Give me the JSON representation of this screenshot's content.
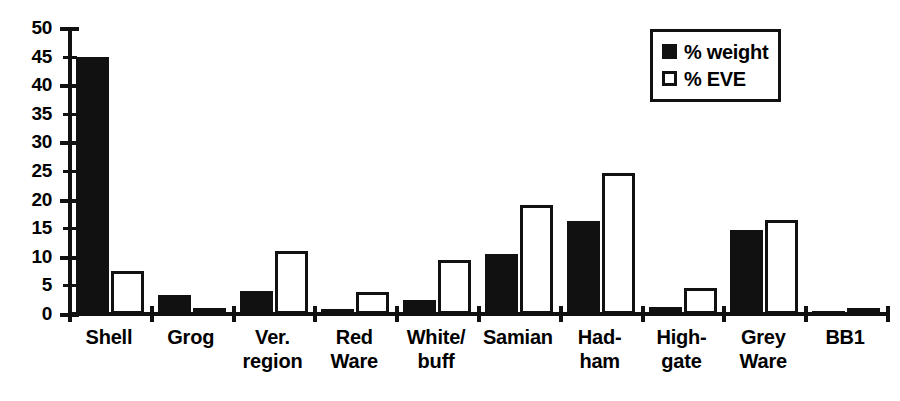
{
  "chart_data": {
    "type": "bar",
    "title": "",
    "xlabel": "",
    "ylabel": "",
    "ylim": [
      0,
      50
    ],
    "yticks": [
      0,
      5,
      10,
      15,
      20,
      25,
      30,
      35,
      40,
      45,
      50
    ],
    "grid": false,
    "legend_position": "top-right",
    "categories": [
      "Shell",
      "Grog",
      "Ver. region",
      "Red Ware",
      "White/ buff",
      "Samian",
      "Had- ham",
      "High- gate",
      "Grey Ware",
      "BB1"
    ],
    "category_lines": [
      [
        "Shell"
      ],
      [
        "Grog"
      ],
      [
        "Ver.",
        "region"
      ],
      [
        "Red",
        "Ware"
      ],
      [
        "White/",
        "buff"
      ],
      [
        "Samian"
      ],
      [
        "Had-",
        "ham"
      ],
      [
        "High-",
        "gate"
      ],
      [
        "Grey",
        "Ware"
      ],
      [
        "BB1"
      ]
    ],
    "series": [
      {
        "name": "% weight",
        "color": "#111111",
        "style": "filled",
        "values": [
          45.0,
          3.3,
          4.0,
          0.8,
          2.4,
          10.5,
          16.2,
          1.2,
          14.7,
          0.3
        ]
      },
      {
        "name": "% EVE",
        "color": "#ffffff",
        "style": "hollow",
        "values": [
          7.6,
          0.7,
          11.0,
          3.8,
          9.5,
          19.0,
          24.7,
          4.6,
          16.4,
          0.2
        ]
      }
    ]
  },
  "legend": {
    "entries": [
      {
        "label": "% weight",
        "swatch": "filled-square"
      },
      {
        "label": "% EVE",
        "swatch": "hollow-square"
      }
    ]
  },
  "axis": {
    "y_tick_labels": [
      "50",
      "45",
      "40",
      "35",
      "30",
      "25",
      "20",
      "15",
      "10",
      "5",
      "0"
    ]
  }
}
